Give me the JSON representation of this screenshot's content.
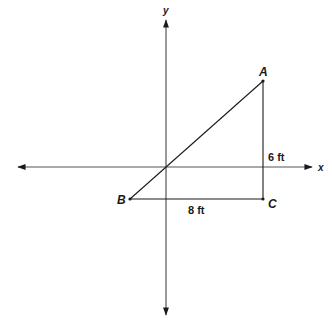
{
  "diagram": {
    "type": "coordinate-plane-right-triangle",
    "colors": {
      "line": "#1a1a1a",
      "background": "#ffffff"
    },
    "axes": {
      "x_label": "x",
      "y_label": "y"
    },
    "points": {
      "A": {
        "label": "A"
      },
      "B": {
        "label": "B"
      },
      "C": {
        "label": "C"
      }
    },
    "segments": {
      "AC": {
        "length_label": "6 ft"
      },
      "BC": {
        "length_label": "8 ft"
      },
      "AB": {
        "length_label": ""
      }
    }
  }
}
